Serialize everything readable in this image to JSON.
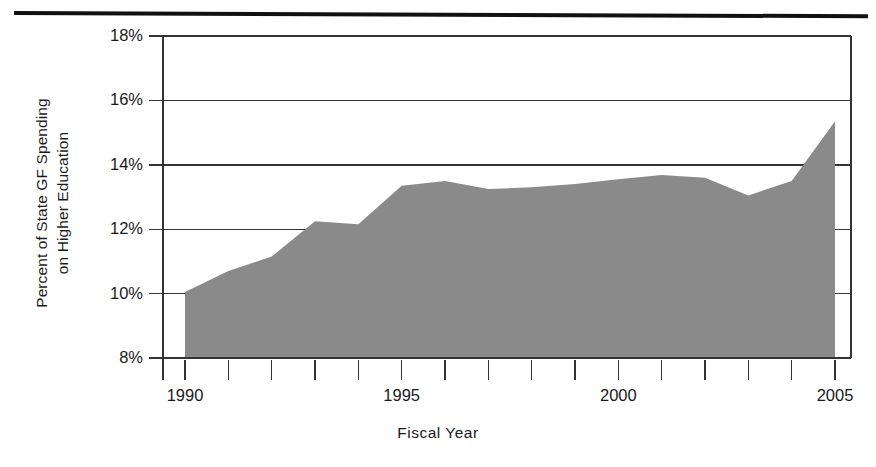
{
  "figure": {
    "top_rule": "decorative-rule"
  },
  "chart_data": {
    "type": "area",
    "title": "",
    "xlabel": "Fiscal Year",
    "ylabel": "Percent of State GF Spending\non Higher Education",
    "x": [
      1990,
      1991,
      1992,
      1993,
      1994,
      1995,
      1996,
      1997,
      1998,
      1999,
      2000,
      2001,
      2002,
      2003,
      2004,
      2005
    ],
    "values": [
      10.05,
      10.7,
      11.15,
      12.25,
      12.15,
      13.35,
      13.5,
      13.25,
      13.3,
      13.4,
      13.55,
      13.68,
      13.6,
      13.05,
      13.5,
      15.35
    ],
    "series": [
      {
        "name": "Percent of State GF Spending on Higher Education",
        "values": [
          10.05,
          10.7,
          11.15,
          12.25,
          12.15,
          13.35,
          13.5,
          13.25,
          13.3,
          13.4,
          13.55,
          13.68,
          13.6,
          13.05,
          13.5,
          15.35
        ]
      }
    ],
    "xlim": [
      1990,
      2005
    ],
    "ylim": [
      8,
      18
    ],
    "ytick_labels": [
      "18%",
      "16%",
      "14%",
      "12%",
      "10%",
      "8%"
    ],
    "ytick_values": [
      18,
      16,
      14,
      12,
      10,
      8
    ],
    "xtick_labels": [
      "1990",
      "1995",
      "2000",
      "2005"
    ],
    "xtick_values": [
      1990,
      1995,
      2000,
      2005
    ],
    "xtick_minor_values": [
      1990,
      1991,
      1992,
      1993,
      1994,
      1995,
      1996,
      1997,
      1998,
      1999,
      2000,
      2001,
      2002,
      2003,
      2004,
      2005
    ],
    "grid": "horizontal",
    "legend": "none",
    "area_color": "#8a8a8a",
    "axis_color": "#333333",
    "grid_color": "#333333",
    "background_color": "#ffffff"
  }
}
